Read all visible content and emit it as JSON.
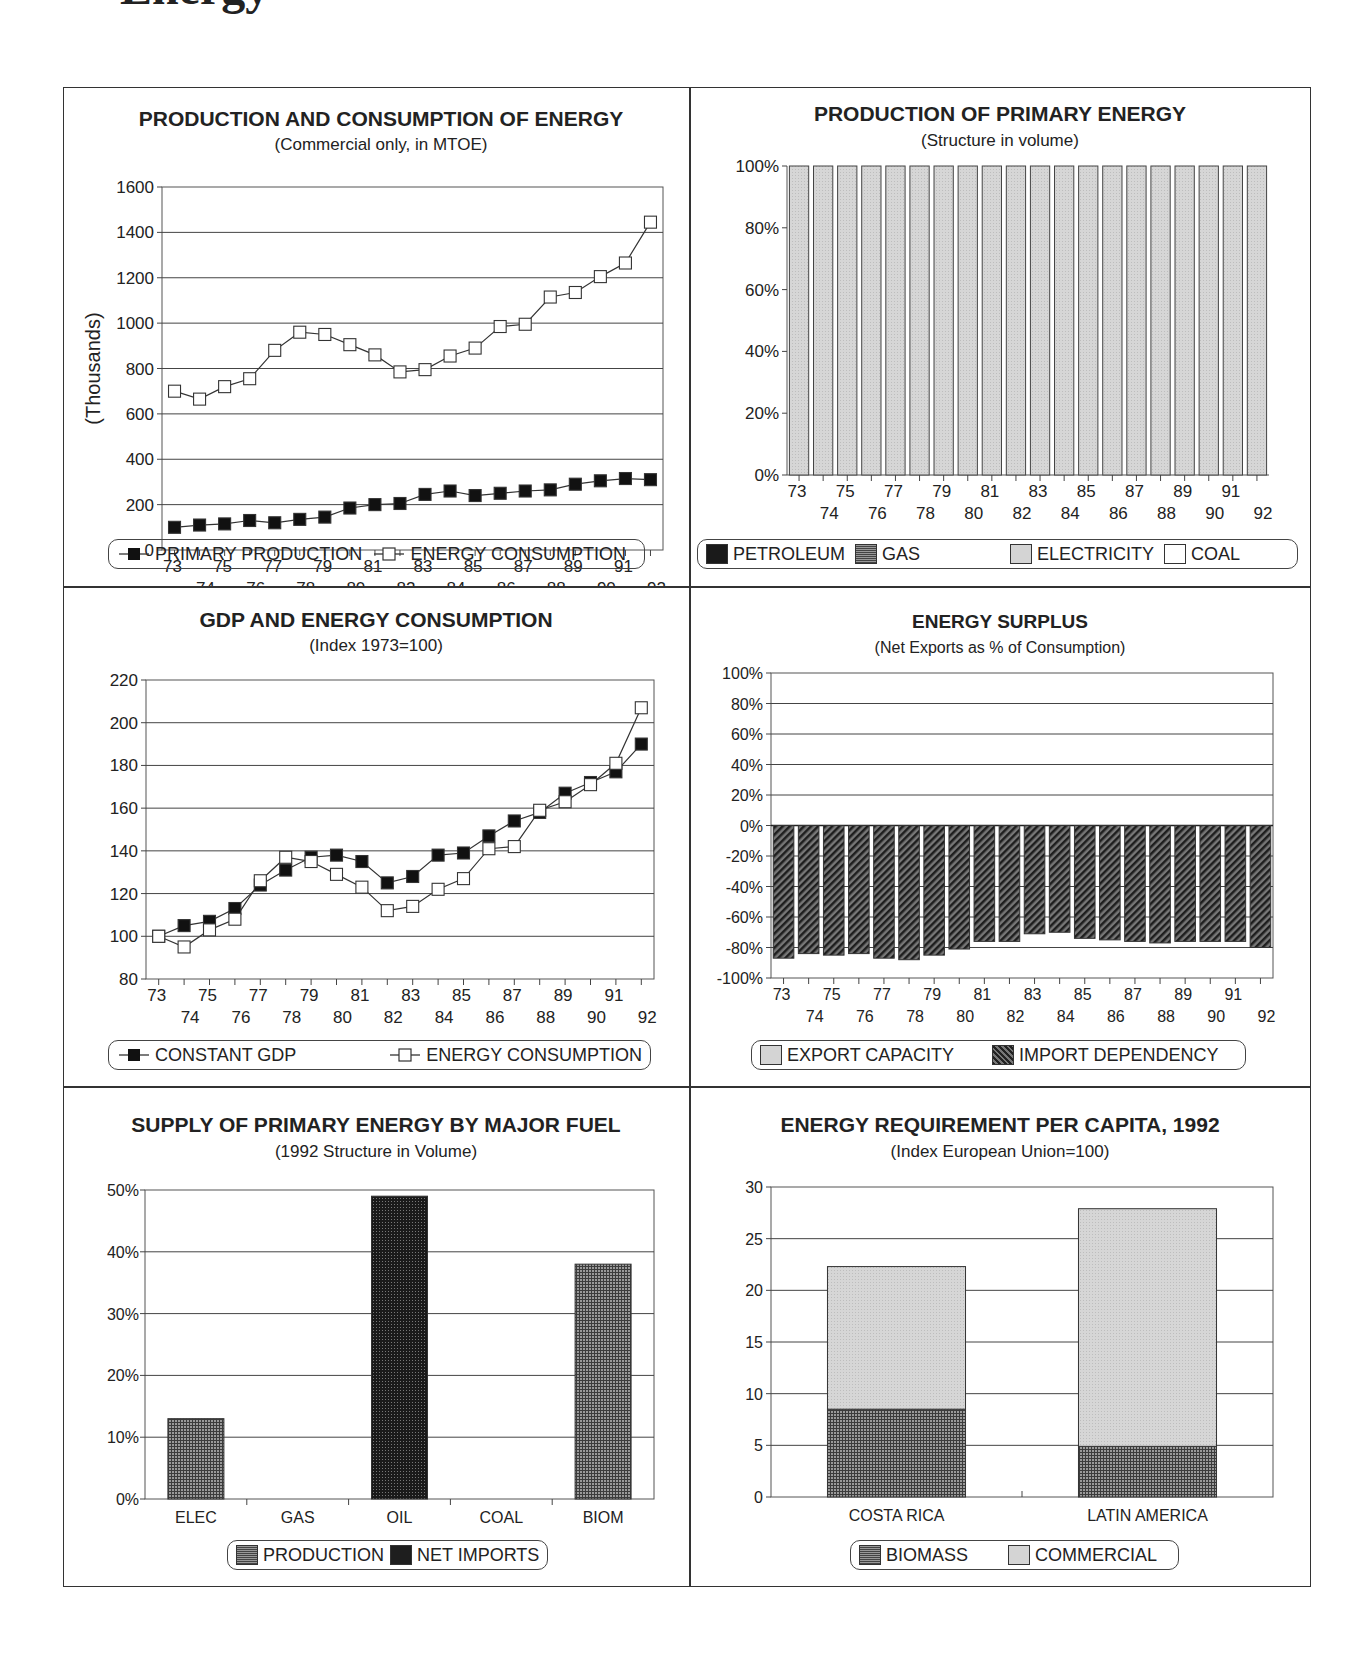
{
  "page": {
    "heading_fragment": "Energy"
  },
  "chart_data": [
    {
      "id": "prod_cons",
      "type": "line",
      "title": "PRODUCTION AND CONSUMPTION OF ENERGY",
      "subtitle": "(Commercial only, in MTOE)",
      "ylabel": "(Thousands)",
      "xlabel": "",
      "ylim": [
        0,
        1600
      ],
      "yticks": [
        0,
        200,
        400,
        600,
        800,
        1000,
        1200,
        1400,
        1600
      ],
      "grid": true,
      "legend_position": "bottom",
      "x": [
        "73",
        "74",
        "75",
        "76",
        "77",
        "78",
        "79",
        "80",
        "81",
        "82",
        "83",
        "84",
        "85",
        "86",
        "87",
        "88",
        "89",
        "90",
        "91",
        "92"
      ],
      "series": [
        {
          "name": "PRIMARY PRODUCTION",
          "marker": "filled-square",
          "values": [
            100,
            110,
            115,
            130,
            120,
            135,
            145,
            185,
            200,
            205,
            245,
            260,
            240,
            250,
            260,
            265,
            290,
            305,
            315,
            310
          ]
        },
        {
          "name": "ENERGY CONSUMPTION",
          "marker": "open-square",
          "values": [
            700,
            665,
            720,
            755,
            880,
            960,
            950,
            905,
            860,
            785,
            795,
            855,
            890,
            985,
            995,
            1115,
            1135,
            1205,
            1265,
            1445
          ]
        }
      ]
    },
    {
      "id": "prod_structure",
      "type": "bar",
      "stacked": true,
      "title": "PRODUCTION OF PRIMARY ENERGY",
      "subtitle": "(Structure in volume)",
      "xlabel": "",
      "ylabel": "",
      "ylim": [
        0,
        100
      ],
      "yticks": [
        "0%",
        "20%",
        "40%",
        "60%",
        "80%",
        "100%"
      ],
      "grid": false,
      "legend_position": "bottom",
      "categories": [
        "73",
        "74",
        "75",
        "76",
        "77",
        "78",
        "79",
        "80",
        "81",
        "82",
        "83",
        "84",
        "85",
        "86",
        "87",
        "88",
        "89",
        "90",
        "91",
        "92"
      ],
      "series": [
        {
          "name": "PETROLEUM",
          "values": [
            0,
            0,
            0,
            0,
            0,
            0,
            0,
            0,
            0,
            0,
            0,
            0,
            0,
            0,
            0,
            0,
            0,
            0,
            0,
            0
          ]
        },
        {
          "name": "GAS",
          "values": [
            0,
            0,
            0,
            0,
            0,
            0,
            0,
            0,
            0,
            0,
            0,
            0,
            0,
            0,
            0,
            0,
            0,
            0,
            0,
            0
          ]
        },
        {
          "name": "ELECTRICITY",
          "values": [
            100,
            100,
            100,
            100,
            100,
            100,
            100,
            100,
            100,
            100,
            100,
            100,
            100,
            100,
            100,
            100,
            100,
            100,
            100,
            100
          ]
        },
        {
          "name": "COAL",
          "values": [
            0,
            0,
            0,
            0,
            0,
            0,
            0,
            0,
            0,
            0,
            0,
            0,
            0,
            0,
            0,
            0,
            0,
            0,
            0,
            0
          ]
        }
      ]
    },
    {
      "id": "gdp_energy",
      "type": "line",
      "title": "GDP AND ENERGY CONSUMPTION",
      "subtitle": "(Index 1973=100)",
      "xlabel": "",
      "ylabel": "",
      "ylim": [
        80,
        220
      ],
      "yticks": [
        80,
        100,
        120,
        140,
        160,
        180,
        200,
        220
      ],
      "grid": true,
      "legend_position": "bottom",
      "x": [
        "73",
        "74",
        "75",
        "76",
        "77",
        "78",
        "79",
        "80",
        "81",
        "82",
        "83",
        "84",
        "85",
        "86",
        "87",
        "88",
        "89",
        "90",
        "91",
        "92"
      ],
      "series": [
        {
          "name": "CONSTANT GDP",
          "marker": "filled-square",
          "values": [
            100,
            105,
            107,
            113,
            124,
            131,
            137,
            138,
            135,
            125,
            128,
            138,
            139,
            147,
            154,
            158,
            167,
            172,
            177,
            190
          ]
        },
        {
          "name": "ENERGY CONSUMPTION",
          "marker": "open-square",
          "values": [
            100,
            95,
            103,
            108,
            126,
            137,
            135,
            129,
            123,
            112,
            114,
            122,
            127,
            141,
            142,
            159,
            163,
            171,
            181,
            207
          ]
        }
      ]
    },
    {
      "id": "energy_surplus",
      "type": "bar",
      "title": "ENERGY SURPLUS",
      "subtitle": "(Net Exports as % of Consumption)",
      "xlabel": "",
      "ylabel": "",
      "ylim": [
        -100,
        100
      ],
      "yticks": [
        "-100%",
        "-80%",
        "-60%",
        "-40%",
        "-20%",
        "0%",
        "20%",
        "40%",
        "60%",
        "80%",
        "100%"
      ],
      "grid": true,
      "legend_position": "bottom",
      "categories": [
        "73",
        "74",
        "75",
        "76",
        "77",
        "78",
        "79",
        "80",
        "81",
        "82",
        "83",
        "84",
        "85",
        "86",
        "87",
        "88",
        "89",
        "90",
        "91",
        "92"
      ],
      "series": [
        {
          "name": "EXPORT CAPACITY",
          "values": [
            0,
            0,
            0,
            0,
            0,
            0,
            0,
            0,
            0,
            0,
            0,
            0,
            0,
            0,
            0,
            0,
            0,
            0,
            0,
            0
          ]
        },
        {
          "name": "IMPORT DEPENDENCY",
          "values": [
            -87,
            -84,
            -85,
            -84,
            -87,
            -88,
            -85,
            -81,
            -76,
            -76,
            -71,
            -70,
            -74,
            -75,
            -76,
            -77,
            -76,
            -76,
            -76,
            -80
          ]
        }
      ]
    },
    {
      "id": "supply_fuel",
      "type": "bar",
      "title": "SUPPLY OF PRIMARY ENERGY BY MAJOR FUEL",
      "subtitle": "(1992 Structure in Volume)",
      "xlabel": "",
      "ylabel": "",
      "ylim": [
        0,
        50
      ],
      "yticks": [
        "0%",
        "10%",
        "20%",
        "30%",
        "40%",
        "50%"
      ],
      "grid": true,
      "legend_position": "bottom",
      "categories": [
        "ELEC",
        "GAS",
        "OIL",
        "COAL",
        "BIOM"
      ],
      "series": [
        {
          "name": "PRODUCTION",
          "values": [
            13,
            0,
            0,
            0,
            38
          ]
        },
        {
          "name": "NET IMPORTS",
          "values": [
            0,
            0,
            49,
            0,
            0
          ]
        }
      ]
    },
    {
      "id": "per_capita",
      "type": "bar",
      "stacked": true,
      "title": "ENERGY REQUIREMENT PER CAPITA, 1992",
      "subtitle": "(Index European Union=100)",
      "xlabel": "",
      "ylabel": "",
      "ylim": [
        0,
        30
      ],
      "yticks": [
        0,
        5,
        10,
        15,
        20,
        25,
        30
      ],
      "grid": true,
      "legend_position": "bottom",
      "categories": [
        "COSTA RICA",
        "LATIN AMERICA"
      ],
      "series": [
        {
          "name": "BIOMASS",
          "values": [
            8.5,
            4.9
          ]
        },
        {
          "name": "COMMERCIAL",
          "values": [
            13.8,
            23.0
          ]
        }
      ]
    }
  ]
}
